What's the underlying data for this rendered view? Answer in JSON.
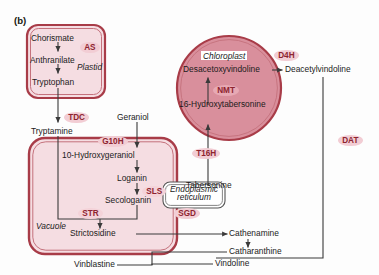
{
  "panel": {
    "tag": "(b)"
  },
  "colors": {
    "membrane_stroke": "#a83c48",
    "membrane_inner_stroke": "#c4717c",
    "compartment_light_fill": "#f5dde2",
    "chloroplast_fill": "#d98f9c",
    "enzyme_fill": "#f2cdd4",
    "enzyme_fill_dark": "#e7a9b4",
    "enzyme_text": "#8e2430",
    "arrow": "#3a3a3a",
    "metabolite_text": "#1b1b1b",
    "background": "#fdfdfd"
  },
  "compartments": [
    {
      "id": "plastid",
      "name": "Plastid",
      "shape": "rounded-rect",
      "boxed_label": false
    },
    {
      "id": "vacuole",
      "name": "Vacuole",
      "shape": "rounded-rect",
      "boxed_label": false
    },
    {
      "id": "chloroplast",
      "name": "Chloroplast",
      "shape": "circle",
      "boxed_label": true
    },
    {
      "id": "er",
      "name": "Endoplasmic reticulum",
      "shape": "rounded-rect",
      "boxed_label": true
    }
  ],
  "metabolites": [
    {
      "id": "chorismate",
      "label": "Chorismate"
    },
    {
      "id": "anthranilate",
      "label": "Anthranilate"
    },
    {
      "id": "tryptophan",
      "label": "Tryptophan"
    },
    {
      "id": "tryptamine",
      "label": "Tryptamine"
    },
    {
      "id": "geraniol",
      "label": "Geraniol"
    },
    {
      "id": "hydroxygeraniol",
      "label": "10-Hydroxygeraniol"
    },
    {
      "id": "loganin",
      "label": "Loganin"
    },
    {
      "id": "secologanin",
      "label": "Secologanin"
    },
    {
      "id": "strictosidine",
      "label": "Strictosidine"
    },
    {
      "id": "cathenamine",
      "label": "Cathenamine"
    },
    {
      "id": "catharanthine",
      "label": "Catharanthine"
    },
    {
      "id": "tabersonine",
      "label": "Tabersonine"
    },
    {
      "id": "hydroxytabersonine",
      "label": "16-Hydroxytabersonine"
    },
    {
      "id": "desacetoxyvindoline",
      "label": "Desacetoxyvindoline"
    },
    {
      "id": "deacetylvindoline",
      "label": "Deacetylvindoline"
    },
    {
      "id": "vindoline",
      "label": "Vindoline"
    },
    {
      "id": "vinblastine",
      "label": "Vinblastine"
    }
  ],
  "enzymes": [
    {
      "id": "as",
      "label": "AS"
    },
    {
      "id": "tdc",
      "label": "TDC"
    },
    {
      "id": "g10h",
      "label": "G10H"
    },
    {
      "id": "sls",
      "label": "SLS"
    },
    {
      "id": "str",
      "label": "STR"
    },
    {
      "id": "sgd",
      "label": "SGD"
    },
    {
      "id": "t16h",
      "label": "T16H"
    },
    {
      "id": "nmt",
      "label": "NMT"
    },
    {
      "id": "d4h",
      "label": "D4H"
    },
    {
      "id": "dat",
      "label": "DAT"
    }
  ],
  "reactions": [
    {
      "from": "chorismate",
      "to": "anthranilate",
      "enzyme": "as"
    },
    {
      "from": "anthranilate",
      "to": "tryptophan",
      "enzyme": null
    },
    {
      "from": "tryptophan",
      "to": "tryptamine",
      "enzyme": "tdc"
    },
    {
      "from": "geraniol",
      "to": "hydroxygeraniol",
      "enzyme": "g10h"
    },
    {
      "from": "hydroxygeraniol",
      "to": "loganin",
      "enzyme": null
    },
    {
      "from": "loganin",
      "to": "secologanin",
      "enzyme": "sls"
    },
    {
      "from": "secologanin",
      "to": "strictosidine",
      "enzyme": "str"
    },
    {
      "from": "tryptamine",
      "to": "strictosidine",
      "enzyme": "str"
    },
    {
      "from": "strictosidine",
      "to": "cathenamine",
      "enzyme": "sgd"
    },
    {
      "from": "cathenamine",
      "to": "catharanthine",
      "enzyme": null
    },
    {
      "from": "tabersonine",
      "to": "hydroxytabersonine",
      "enzyme": "t16h"
    },
    {
      "from": "hydroxytabersonine",
      "to": "desacetoxyvindoline",
      "enzyme": "nmt"
    },
    {
      "from": "desacetoxyvindoline",
      "to": "deacetylvindoline",
      "enzyme": "d4h"
    },
    {
      "from": "deacetylvindoline",
      "to": "vindoline",
      "enzyme": "dat"
    },
    {
      "from": "catharanthine",
      "to": "vinblastine",
      "enzyme": null
    },
    {
      "from": "vindoline",
      "to": "vinblastine",
      "enzyme": null
    }
  ]
}
